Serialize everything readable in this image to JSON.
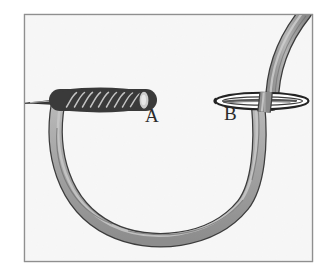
{
  "figure": {
    "type": "line-art-illustration",
    "canvas": {
      "width": 333,
      "height": 274
    },
    "frame": {
      "name": "illustration-border",
      "x": 24,
      "y": 14,
      "width": 289,
      "height": 248,
      "border_color": "#9a9a9a",
      "fill_color": "#fbfbfb"
    },
    "colors": {
      "background": "#ffffff",
      "paper": "#fbfbfb",
      "thread_fill": "#a0a0a0",
      "thread_fill_light": "#c2c2c2",
      "thread_outline": "#3a3a3a",
      "needle_dark": "#2e2e2e",
      "needle_eye_fill": "#ffffff",
      "label_color": "#2b2b2b",
      "border": "#9a9a9a"
    },
    "labels": [
      {
        "id": "A",
        "text": "A",
        "x": 145,
        "y": 106,
        "describes": "end of coiled wraps on the needle"
      },
      {
        "id": "B",
        "text": "B",
        "x": 224,
        "y": 104,
        "describes": "needle eye where thread passes through"
      }
    ],
    "elements": [
      {
        "name": "needle-point",
        "description": "tapered dark needle tip entering from left edge",
        "x1": 25,
        "y1": 103,
        "x2": 62,
        "y2": 101
      },
      {
        "name": "coiled-thread-wraps",
        "description": "row of diagonal thread coils wrapped around the needle shaft",
        "x1": 58,
        "y1": 88,
        "x2": 146,
        "y2": 112,
        "wrap_count": 10
      },
      {
        "name": "thread-loop",
        "description": "large U-shaped loop of thread hanging below between A and B",
        "left_x": 57,
        "right_x": 256,
        "top_y": 104,
        "bottom_y": 238
      },
      {
        "name": "needle-eye",
        "description": "elongated oval eye of the needle at B with thread through it",
        "cx": 262,
        "cy": 101,
        "rx": 47,
        "ry": 8
      },
      {
        "name": "thread-tail-upper",
        "description": "thread rising from needle eye and exiting the top edge of the frame",
        "from_x": 272,
        "from_y": 101,
        "to_x": 305,
        "to_y": 16
      }
    ]
  }
}
